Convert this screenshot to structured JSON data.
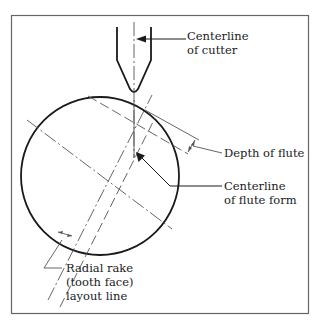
{
  "figure": {
    "type": "technical-drawing",
    "colors": {
      "line": "#1a1a1a",
      "thin": "#555555",
      "frame": "#666666",
      "background": "#ffffff"
    }
  },
  "labels": {
    "centerline_cutter": {
      "line1": "Centerline",
      "line2": "of cutter"
    },
    "depth_of_flute": {
      "line1": "Depth of flute"
    },
    "centerline_flute_form": {
      "line1": "Centerline",
      "line2": "of flute form"
    },
    "radial_rake": {
      "line1": "Radial rake",
      "line2": "(tooth face)",
      "line3": "layout line"
    }
  }
}
